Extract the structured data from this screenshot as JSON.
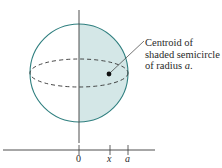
{
  "diagram": {
    "annotation": {
      "line1": "Centroid of",
      "line2": "shaded semicircle",
      "line3": "of radius ",
      "line3_var": "a",
      "line3_end": "."
    },
    "axis_labels": {
      "origin": "0",
      "x": "x",
      "a": "a"
    },
    "colors": {
      "circle_stroke": "#2f7f7f",
      "shade_fill": "#d4e7e7",
      "axis": "#3a3a3a",
      "dot": "#111111"
    }
  }
}
